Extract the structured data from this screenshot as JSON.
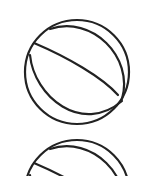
{
  "canvas": {
    "width": 161,
    "height": 176,
    "background": "#ffffff"
  },
  "icons": [
    {
      "name": "ball-icon",
      "cx": 77,
      "cy": 72,
      "r": 53,
      "stroke": "#222222"
    },
    {
      "name": "ball-icon",
      "cx": 77,
      "cy": 192,
      "r": 53,
      "stroke": "#222222"
    }
  ]
}
